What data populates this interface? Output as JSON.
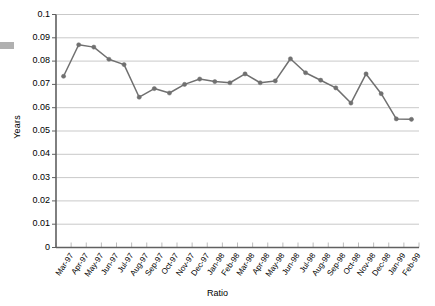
{
  "chart_data": {
    "type": "line",
    "title": "",
    "xlabel": "Ratio",
    "ylabel": "Years",
    "ylim": [
      0,
      0.1
    ],
    "ytick_step": 0.01,
    "grid": true,
    "legend": false,
    "marker": "circle",
    "series_color": "#707070",
    "categories": [
      "Mar-97",
      "Apr-97",
      "May-97",
      "Jun-97",
      "Jul-97",
      "Aug-97",
      "Sep-97",
      "Oct-97",
      "Nov-97",
      "Dec-97",
      "Jan-98",
      "Feb-98",
      "Mar-98",
      "Apr-98",
      "May-98",
      "Jun-98",
      "Jul-98",
      "Aug-98",
      "Sep-98",
      "Oct-98",
      "Nov-98",
      "Dec-98",
      "Jan-99",
      "Feb-99"
    ],
    "values": [
      0.0735,
      0.087,
      0.086,
      0.0808,
      0.0785,
      0.0645,
      0.0682,
      0.0663,
      0.07,
      0.0723,
      0.0712,
      0.0707,
      0.0745,
      0.0707,
      0.0715,
      0.081,
      0.075,
      0.0718,
      0.0685,
      0.062,
      0.0745,
      0.066,
      0.0552,
      0.055
    ],
    "ytick_labels": [
      "0.1",
      "0.09",
      "0.08",
      "0.07",
      "0.06",
      "0.05",
      "0.04",
      "0.03",
      "0.02",
      "0.01",
      "0"
    ],
    "ytick_values": [
      0.1,
      0.09,
      0.08,
      0.07,
      0.06,
      0.05,
      0.04,
      0.03,
      0.02,
      0.01,
      0
    ]
  },
  "axes": {
    "y_title": "Years",
    "x_title": "Ratio"
  }
}
